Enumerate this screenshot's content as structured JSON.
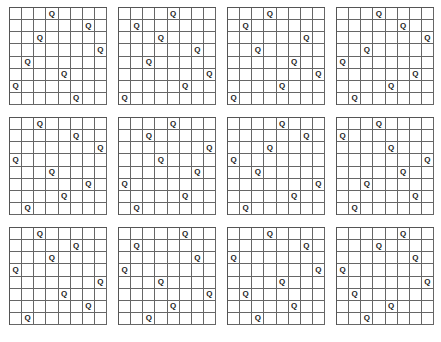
{
  "figure": {
    "title": "",
    "board_size": 8,
    "queen_symbol": "Q",
    "grid_color": "#666666",
    "layout": {
      "rows": 3,
      "columns": 4
    },
    "caption": ""
  },
  "solutions": [
    {
      "id": 1,
      "queen_columns_by_row": [
        3,
        6,
        2,
        7,
        1,
        4,
        0,
        5
      ]
    },
    {
      "id": 2,
      "queen_columns_by_row": [
        4,
        1,
        3,
        6,
        2,
        7,
        5,
        0
      ]
    },
    {
      "id": 3,
      "queen_columns_by_row": [
        3,
        1,
        6,
        2,
        5,
        7,
        4,
        0
      ]
    },
    {
      "id": 4,
      "queen_columns_by_row": [
        3,
        5,
        7,
        2,
        0,
        6,
        4,
        1
      ]
    },
    {
      "id": 5,
      "queen_columns_by_row": [
        2,
        5,
        7,
        0,
        3,
        6,
        4,
        1
      ]
    },
    {
      "id": 6,
      "queen_columns_by_row": [
        4,
        2,
        7,
        3,
        6,
        0,
        5,
        1
      ]
    },
    {
      "id": 7,
      "queen_columns_by_row": [
        4,
        6,
        3,
        0,
        2,
        7,
        5,
        1
      ]
    },
    {
      "id": 8,
      "queen_columns_by_row": [
        3,
        0,
        4,
        7,
        5,
        2,
        6,
        1
      ]
    },
    {
      "id": 9,
      "queen_columns_by_row": [
        2,
        5,
        3,
        0,
        7,
        4,
        6,
        1
      ]
    },
    {
      "id": 10,
      "queen_columns_by_row": [
        5,
        1,
        6,
        0,
        3,
        7,
        4,
        2
      ]
    },
    {
      "id": 11,
      "queen_columns_by_row": [
        3,
        6,
        0,
        7,
        4,
        1,
        5,
        2
      ]
    },
    {
      "id": 12,
      "queen_columns_by_row": [
        5,
        3,
        6,
        0,
        7,
        1,
        4,
        2
      ]
    }
  ]
}
